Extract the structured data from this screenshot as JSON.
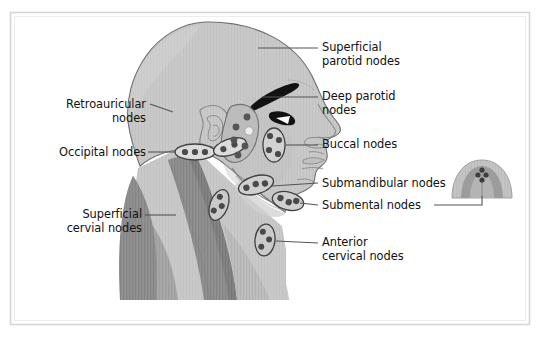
{
  "figure": {
    "canvas": {
      "width": 545,
      "height": 342
    },
    "colors": {
      "page_background": "#ffffff",
      "border_frame": "#d5d5d5",
      "skin_light": "#c9c9c9",
      "skin_shadow": "#b8b8b8",
      "muscle_mid": "#a8a8a8",
      "muscle_dark": "#8f8f8f",
      "muscle_darkest": "#7d7d7d",
      "outline": "#6e6e6e",
      "node_outline": "#4a4a4a",
      "node_dot": "#4a4a4a",
      "node_fill": "#d8d8d8",
      "eye_black": "#111111",
      "leader_line": "#555555",
      "label_text": "#111111"
    }
  },
  "labels": {
    "left": [
      {
        "id": "retroauricular",
        "text": "Retroauricular\nnodes",
        "align": "right",
        "x": 38,
        "y": 98,
        "width": 108,
        "leader": {
          "x1": 152,
          "y1": 105,
          "x2": 172,
          "y2": 112
        }
      },
      {
        "id": "occipital",
        "text": "Occipital nodes",
        "align": "right",
        "x": 26,
        "y": 146,
        "width": 120,
        "leader": {
          "x1": 150,
          "y1": 152,
          "x2": 178,
          "y2": 152
        }
      },
      {
        "id": "superficial-cervical",
        "text": "Superficial\ncervial nodes",
        "align": "right",
        "x": 32,
        "y": 208,
        "width": 110,
        "leader": {
          "x1": 147,
          "y1": 215,
          "x2": 178,
          "y2": 215
        }
      }
    ],
    "right": [
      {
        "id": "superficial-parotid",
        "text": "Superficial\nparotid nodes",
        "align": "left",
        "x": 322,
        "y": 41,
        "width": 130,
        "leader": {
          "x1": 290,
          "y1": 48,
          "x2": 258,
          "y2": 48
        }
      },
      {
        "id": "deep-parotid",
        "text": "Deep parotid\nnodes",
        "align": "left",
        "x": 322,
        "y": 90,
        "width": 130,
        "leader": {
          "x1": 290,
          "y1": 97,
          "x2": 262,
          "y2": 97
        }
      },
      {
        "id": "buccal",
        "text": "Buccal nodes",
        "align": "left",
        "x": 322,
        "y": 138,
        "width": 130,
        "leader": {
          "x1": 290,
          "y1": 145,
          "x2": 268,
          "y2": 145
        }
      },
      {
        "id": "submandibular",
        "text": "Submandibular nodes",
        "align": "left",
        "x": 322,
        "y": 177,
        "width": 150,
        "leader": {
          "x1": 290,
          "y1": 183,
          "x2": 262,
          "y2": 183
        }
      },
      {
        "id": "submental",
        "text": "Submental nodes",
        "align": "left",
        "x": 322,
        "y": 199,
        "width": 150,
        "leader": {
          "x1": 290,
          "y1": 205,
          "x2": 268,
          "y2": 205
        },
        "leader_to_inset": {
          "x1": 433,
          "y1": 205,
          "x2": 482,
          "y2": 205,
          "x3": 482,
          "y3": 186
        }
      },
      {
        "id": "anterior-cervical",
        "text": "Anterior\ncervical nodes",
        "align": "left",
        "x": 322,
        "y": 236,
        "width": 140,
        "leader": {
          "x1": 290,
          "y1": 243,
          "x2": 272,
          "y2": 243
        }
      }
    ]
  },
  "node_clusters": [
    {
      "id": "occipital-nodes",
      "shape": "ellipse",
      "cx": 195,
      "cy": 152,
      "rx": 20,
      "ry": 8,
      "rotate": 0,
      "dots": 3
    },
    {
      "id": "retroauricular-nodes",
      "shape": "ellipse",
      "cx": 230,
      "cy": 147,
      "rx": 17,
      "ry": 8,
      "rotate": -18,
      "dots": 2
    },
    {
      "id": "deep-parotid-nodes",
      "shape": "blob",
      "cx": 243,
      "cy": 135,
      "dots": 5
    },
    {
      "id": "superficial-parotid-nodes",
      "shape": "blob",
      "cx": 243,
      "cy": 122,
      "dots": 0
    },
    {
      "id": "buccal-nodes",
      "shape": "ellipse",
      "cx": 274,
      "cy": 145,
      "rx": 11,
      "ry": 17,
      "rotate": 0,
      "dots": 4
    },
    {
      "id": "submandibular-nodes",
      "shape": "ellipse",
      "cx": 256,
      "cy": 185,
      "rx": 18,
      "ry": 9,
      "rotate": -16,
      "dots": 3
    },
    {
      "id": "submental-nodes",
      "shape": "ellipse",
      "cx": 288,
      "cy": 201,
      "rx": 16,
      "ry": 9,
      "rotate": 14,
      "dots": 3
    },
    {
      "id": "superficial-cervical-nodes",
      "shape": "ellipse",
      "cx": 219,
      "cy": 205,
      "rx": 9,
      "ry": 16,
      "rotate": 20,
      "dots": 3
    },
    {
      "id": "anterior-cervical-nodes",
      "shape": "ellipse",
      "cx": 265,
      "cy": 240,
      "rx": 10,
      "ry": 16,
      "rotate": 6,
      "dots": 3
    },
    {
      "id": "inset-submental-nodes",
      "shape": "cluster",
      "cx": 482,
      "cy": 178,
      "dots": 4
    }
  ],
  "inset": {
    "id": "anterior-view-inset",
    "description": "Anterior (below-chin) view showing submental node group",
    "x": 448,
    "y": 158,
    "width": 70,
    "height": 40
  }
}
